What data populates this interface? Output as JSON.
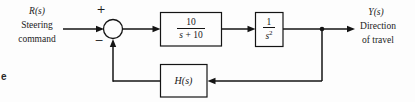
{
  "diagram": {
    "title_hint": "feedback-control-block-diagram",
    "colors": {
      "line": "#141414",
      "background": "#fdfdfd",
      "text": "#1c1c1c"
    },
    "input": {
      "symbol": "R(s)",
      "label_line1": "Steering",
      "label_line2": "command"
    },
    "output": {
      "symbol": "Y(s)",
      "label_line1": "Direction",
      "label_line2": "of travel"
    },
    "summing_junction": {
      "plus_sign": "+",
      "minus_sign": "−"
    },
    "blocks": {
      "controller": {
        "numerator": "10",
        "denominator_var": "s",
        "denominator_rest": " + 10"
      },
      "plant": {
        "numerator": "1",
        "denominator_base": "s",
        "denominator_exponent": "2"
      },
      "feedback": {
        "label": "H(s)"
      }
    },
    "caption_fragment": "e"
  }
}
